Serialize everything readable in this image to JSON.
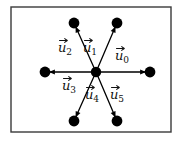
{
  "figure": {
    "type": "vector-diagram",
    "title": "",
    "background_color": "#ffffff",
    "frame": {
      "name": "outer-rectangle-frame",
      "x": 11,
      "y": 7,
      "width": 160,
      "height": 125,
      "stroke_color": "#3a3a3a",
      "stroke_width": 1.4,
      "fill": "#ffffff"
    },
    "center_node": {
      "name": "central-hub-dot",
      "x": 96,
      "y": 72,
      "radius": 5.2,
      "color": "#000000"
    },
    "node_color": "#000000",
    "node_radius": 5.4,
    "edge_color": "#000000",
    "edge_width": 1.3,
    "vectors": [
      {
        "id": "u0",
        "label_base": "u",
        "label_sub": "0",
        "accent": "vector-arrow",
        "direction_deg": 0,
        "tip_x": 150,
        "tip_y": 72,
        "label_x": 122,
        "label_y": 60,
        "arrowhead_at": "tip"
      },
      {
        "id": "u1",
        "label_base": "u",
        "label_sub": "1",
        "accent": "vector-arrow",
        "direction_deg": 60,
        "tip_x": 117,
        "tip_y": 23,
        "label_x": 90,
        "label_y": 52,
        "arrowhead_at": "tip"
      },
      {
        "id": "u2",
        "label_base": "u",
        "label_sub": "2",
        "accent": "vector-arrow",
        "direction_deg": 120,
        "tip_x": 74,
        "tip_y": 23,
        "label_x": 65,
        "label_y": 52,
        "arrowhead_at": "tip"
      },
      {
        "id": "u3",
        "label_base": "u",
        "label_sub": "3",
        "accent": "vector-arrow",
        "direction_deg": 180,
        "tip_x": 45,
        "tip_y": 72,
        "label_x": 69,
        "label_y": 90,
        "arrowhead_at": "tip"
      },
      {
        "id": "u4",
        "label_base": "u",
        "label_sub": "4",
        "accent": "vector-arrow",
        "direction_deg": 240,
        "tip_x": 74,
        "tip_y": 121,
        "label_x": 92,
        "label_y": 99,
        "arrowhead_at": "tip"
      },
      {
        "id": "u5",
        "label_base": "u",
        "label_sub": "5",
        "accent": "vector-arrow",
        "direction_deg": 300,
        "tip_x": 117,
        "tip_y": 121,
        "label_x": 117,
        "label_y": 99,
        "arrowhead_at": "tip"
      }
    ]
  }
}
